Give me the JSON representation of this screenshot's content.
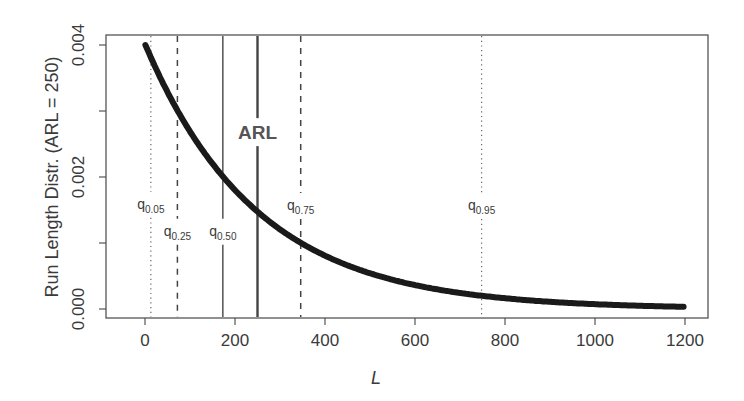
{
  "chart_data": {
    "type": "line",
    "title": "",
    "xlabel": "L",
    "ylabel": "Run Length Distr. (ARL = 250)",
    "xlim": [
      -90,
      1260
    ],
    "ylim": [
      -0.00022,
      0.00419
    ],
    "x_ticks": [
      0,
      200,
      400,
      600,
      800,
      1000,
      1200
    ],
    "x_tick_labels": [
      "0",
      "200",
      "400",
      "600",
      "800",
      "1000",
      "1200"
    ],
    "y_ticks": [
      0.0,
      0.001,
      0.002,
      0.003,
      0.004
    ],
    "y_tick_labels": [
      "0.000",
      "",
      "0.002",
      "",
      "0.004"
    ],
    "grid": false,
    "legend": null,
    "series": [
      {
        "name": "geometric run length pmf",
        "formula": "p*(1-p)^(L-1), p = 1/250",
        "x_range": [
          1,
          1200
        ],
        "x": [
          1,
          50,
          100,
          150,
          200,
          250,
          300,
          400,
          500,
          600,
          700,
          800,
          900,
          1000,
          1100,
          1200
        ],
        "values": [
          0.004,
          0.00328,
          0.00268,
          0.00219,
          0.0018,
          0.00147,
          0.0012,
          0.0008,
          0.00054,
          0.00036,
          0.00024,
          0.00016,
          0.00011,
          7e-05,
          5e-05,
          3e-05
        ],
        "color": "#1a1a1a",
        "line_width": 6
      }
    ],
    "annotations": {
      "arl": {
        "label": "ARL",
        "x": 250,
        "style": "solid-thick",
        "label_y": 0.00268
      },
      "quantiles": [
        {
          "label": "q",
          "sub": "0.05",
          "x": 13,
          "style": "dotted",
          "label_y": 0.00158
        },
        {
          "label": "q",
          "sub": "0.25",
          "x": 72,
          "style": "dashed",
          "label_y": 0.00117
        },
        {
          "label": "q",
          "sub": "0.50",
          "x": 173,
          "style": "solid",
          "label_y": 0.00117
        },
        {
          "label": "q",
          "sub": "0.75",
          "x": 346,
          "style": "dashed",
          "label_y": 0.00156
        },
        {
          "label": "q",
          "sub": "0.95",
          "x": 748,
          "style": "dotted",
          "label_y": 0.00156
        }
      ]
    }
  },
  "labels": {
    "x_axis_title": "L",
    "y_axis_title": "Run Length Distr. (ARL = 250)",
    "arl": "ARL"
  }
}
